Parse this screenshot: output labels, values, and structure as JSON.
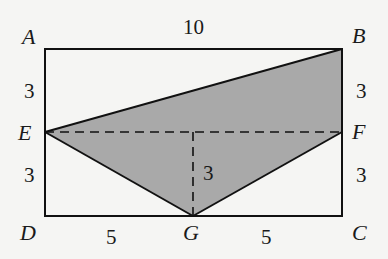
{
  "diagram": {
    "type": "geometry",
    "colors": {
      "background": "#f5f5f3",
      "stroke": "#111111",
      "shaded_region": "#a9a9a9"
    },
    "points": {
      "A": {
        "label": "A",
        "x": 45,
        "y": 49
      },
      "B": {
        "label": "B",
        "x": 342,
        "y": 49
      },
      "C": {
        "label": "C",
        "x": 342,
        "y": 216
      },
      "D": {
        "label": "D",
        "x": 45,
        "y": 216
      },
      "E": {
        "label": "E",
        "x": 45,
        "y": 132
      },
      "F": {
        "label": "F",
        "x": 342,
        "y": 132
      },
      "G": {
        "label": "G",
        "x": 193,
        "y": 216
      }
    },
    "shaded_polygon": [
      "E",
      "B",
      "F",
      "G"
    ],
    "segments_solid": [
      [
        "A",
        "B"
      ],
      [
        "B",
        "C"
      ],
      [
        "C",
        "D"
      ],
      [
        "D",
        "A"
      ],
      [
        "E",
        "B"
      ],
      [
        "E",
        "G"
      ],
      [
        "G",
        "F"
      ]
    ],
    "segments_dashed": [
      [
        "E",
        "F"
      ],
      [
        "G",
        "midEF"
      ]
    ],
    "measures": {
      "AB": "10",
      "AE": "3",
      "ED": "3",
      "BF": "3",
      "FC": "3",
      "DG": "5",
      "GC": "5",
      "height_G_to_EF": "3"
    }
  }
}
